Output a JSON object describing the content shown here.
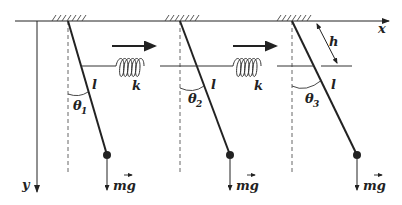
{
  "figure": {
    "type": "coupled-pendulums",
    "axes": {
      "x_label": "x",
      "y_label": "y"
    },
    "spring_label": "k",
    "length_label": "l",
    "height_label": "h",
    "force_label": "mg",
    "angles": [
      "θ1",
      "θ2",
      "θ3"
    ],
    "pendulums": [
      {
        "name": "pendulum-1",
        "angle_label": "θ",
        "angle_sub": "1",
        "length": "l",
        "force": "mg"
      },
      {
        "name": "pendulum-2",
        "angle_label": "θ",
        "angle_sub": "2",
        "length": "l",
        "force": "mg"
      },
      {
        "name": "pendulum-3",
        "angle_label": "θ",
        "angle_sub": "3",
        "length": "l",
        "force": "mg"
      }
    ],
    "springs": [
      {
        "name": "spring-1-2",
        "label": "k"
      },
      {
        "name": "spring-2-3",
        "label": "k"
      }
    ],
    "colors": {
      "line": "#222222",
      "background": "#ffffff"
    }
  }
}
